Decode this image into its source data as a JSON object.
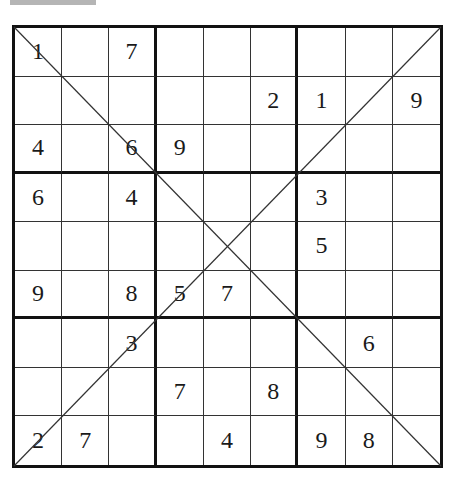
{
  "puzzle": {
    "type": "X-Sudoku",
    "size": 9,
    "grid": [
      [
        "1",
        "",
        "7",
        "",
        "",
        "",
        "",
        "",
        ""
      ],
      [
        "",
        "",
        "",
        "",
        "",
        "2",
        "1",
        "",
        "9"
      ],
      [
        "4",
        "",
        "6",
        "9",
        "",
        "",
        "",
        "",
        ""
      ],
      [
        "6",
        "",
        "4",
        "",
        "",
        "",
        "3",
        "",
        ""
      ],
      [
        "",
        "",
        "",
        "",
        "",
        "",
        "5",
        "",
        ""
      ],
      [
        "9",
        "",
        "8",
        "5",
        "7",
        "",
        "",
        "",
        ""
      ],
      [
        "",
        "",
        "3",
        "",
        "",
        "",
        "",
        "6",
        ""
      ],
      [
        "",
        "",
        "",
        "7",
        "",
        "8",
        "",
        "",
        ""
      ],
      [
        "2",
        "7",
        "",
        "",
        "4",
        "",
        "9",
        "8",
        ""
      ]
    ],
    "diagonals": [
      "main-diagonal",
      "anti-diagonal"
    ]
  },
  "colors": {
    "grid_line": "#111111",
    "digit": "#1a1a1a",
    "top_bar": "#b5b5b5",
    "background": "#ffffff"
  }
}
